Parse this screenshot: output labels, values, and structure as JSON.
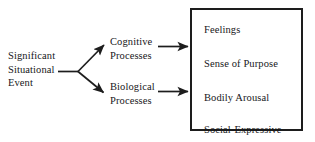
{
  "diagram": {
    "colors": {
      "background": "#ffffff",
      "ink": "#17171a",
      "box_border": "#1d1d1d"
    },
    "source": {
      "lines": [
        "Significant",
        "Situational",
        "Event"
      ]
    },
    "branches": [
      {
        "id": "cognitive",
        "lines": [
          "Cognitive",
          "Processes"
        ]
      },
      {
        "id": "biological",
        "lines": [
          "Biological",
          "Processes"
        ]
      }
    ],
    "outcome_box": {
      "items": [
        "Feelings",
        "Sense of Purpose",
        "Bodily Arousal",
        "Social-Expressive"
      ]
    },
    "arrows": [
      {
        "id": "stem",
        "from": "source",
        "to": "fork",
        "style": "line"
      },
      {
        "id": "fork-up",
        "from": "fork",
        "to": "cognitive",
        "style": "arrow"
      },
      {
        "id": "fork-down",
        "from": "fork",
        "to": "biological",
        "style": "arrow"
      },
      {
        "id": "cognitive-to-box",
        "from": "cognitive",
        "to": "outcome-box",
        "style": "arrow"
      },
      {
        "id": "biological-to-box",
        "from": "biological",
        "to": "outcome-box",
        "style": "arrow"
      }
    ]
  }
}
